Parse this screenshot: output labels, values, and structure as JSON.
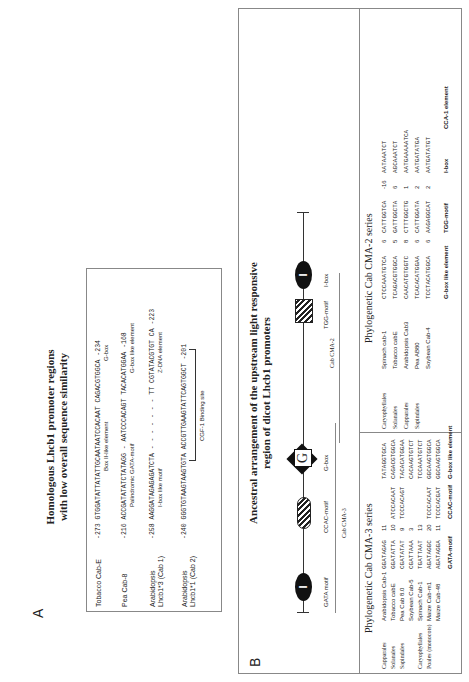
{
  "panel_a": {
    "label": "A",
    "title_line1": "Homologous Lhcb1 promoter regions",
    "title_line2": "with low overall sequence similarity",
    "rows": [
      {
        "name": "Tobacco Cab-E",
        "seq": "-273 GTGGATATTATATTGCAATAATCCACAAT CAGACGTGGCA -234",
        "annotation": "Box II-like element",
        "annotation2": "G-box"
      },
      {
        "name": "Pea Cab-8",
        "seq": "-216 ACCGATATATCTATAGG - AATCCCACAGT TACACATGGAA -168",
        "annotation": "Palindromic GATA-motif",
        "annotation2": "G-box like element"
      },
      {
        "name": "Arabidopsis Lhcb1*3 (Cab 1)",
        "seq": "-258 AAGGATAGAGAGATCTA - - - - - - - TT CGTATACGTGT CA -223",
        "annotation": "I-box like motif",
        "annotation2": "Z-DNA element"
      },
      {
        "name": "Arabidopsis Lhcb1*1 (Cab 2)",
        "seq": "-240 GGGTGTAAGTAAGTGTA ACCGTTGAAGTATTCAGTGGCT -201",
        "annotation": "CGF-1 Binding site"
      }
    ]
  },
  "panel_b": {
    "label": "B",
    "ancestral_title_line1": "Ancestral arrangement of the upstream light responsive",
    "ancestral_title_line2": "region of dicot Lhcb1 promoters",
    "motifs": [
      {
        "name": "GATA motif",
        "symbol": "I"
      },
      {
        "name": "CCAC-motif",
        "symbol": ""
      },
      {
        "name": "G-box",
        "symbol": "G"
      },
      {
        "name": "TGG-motif",
        "symbol": ""
      },
      {
        "name": "I-box",
        "symbol": "I"
      }
    ],
    "cma3_label": "Cab CMA-3",
    "cma2_label": "Cab CMA-2",
    "cma3": {
      "title": "Phylogenetic Cab CMA-3 series",
      "rows": [
        {
          "order": "Capparales",
          "species": "Arabidopsis Cab-1",
          "gata": "GGATAGAG",
          "n1": "11",
          "ccac": "",
          "gbox": "TATAGGTGCA"
        },
        {
          "order": "Solanales",
          "species": "Tobacco cabE",
          "gata": "GGATATTA",
          "n1": "10",
          "ccac": "ATCCACAAT",
          "gbox": "CAGACGTGGCA"
        },
        {
          "order": "Sapindales",
          "species": "Pea Cab 8.0",
          "gata": "CGATATAT",
          "n1": "9",
          "ccac": "TCCCACAGT",
          "gbox": "TACACATGGAA"
        },
        {
          "order": "",
          "species": "Soybean Cab-5",
          "gata": "CGATTAAA",
          "n1": "3",
          "ccac": "",
          "gbox": "CACAAGTGTCT"
        },
        {
          "order": "Caryophyllales",
          "species": "Spinach Cab-1",
          "gata": "TGATTAAT",
          "n1": "13",
          "ccac": "",
          "gbox": "TCCAAATGTCT"
        },
        {
          "order": "Poales (monocots)",
          "species": "Maize Cab-m1",
          "gata": "AGATAGGC",
          "n1": "20",
          "ccac": "TCCCACAAT",
          "gbox": "GGCAAGTGGCA"
        },
        {
          "order": "",
          "species": "Maize Cab-48",
          "gata": "AGATAGGA",
          "n1": "11",
          "ccac": "TCCCACGAT",
          "gbox": "GGCAAGTGGCA"
        }
      ],
      "footer": [
        "GATA-motif",
        "CCAC-motif",
        "G-box like element"
      ]
    },
    "cma2": {
      "title": "Phylogenetic Cab CMA-2 series",
      "rows": [
        {
          "order": "Caryophyllales",
          "species": "Spinach cab-1",
          "gbox": "CTCCAAATGTCA",
          "n1": "6",
          "tgg": "CATTGGTCA",
          "n2": "-16",
          "ibox": "AATAAATCT"
        },
        {
          "order": "Solanales",
          "species": "Tobacco cabE",
          "gbox": "TCAGACGTGGCA",
          "n1": "5",
          "tgg": "GATTGGCTA",
          "n2": "6",
          "ibox": "AGCAAATCT"
        },
        {
          "order": "Capparales",
          "species": "Arabidopsis Cab3",
          "gbox": "CAACATGTGGTC",
          "n1": "8",
          "tgg": "CTTTGGCTG",
          "n2": "1",
          "ibox": "AATGAAAAATCA"
        },
        {
          "order": "Sapindales",
          "species": "Pea AB80",
          "gbox": "TCACACATGGAA",
          "n1": "6",
          "tgg": "CATTGGATA",
          "n2": "2",
          "ibox": "AATGATATGA"
        },
        {
          "order": "",
          "species": "Soybean Cab-4",
          "gbox": "TCCTACATGGCA",
          "n1": "6",
          "tgg": "AAGAGGCAT",
          "n2": "2",
          "ibox": "AATGATATGT"
        }
      ],
      "footer": [
        "G-box like element",
        "TGG-motif",
        "I-box",
        "CCA-1 element"
      ]
    }
  }
}
